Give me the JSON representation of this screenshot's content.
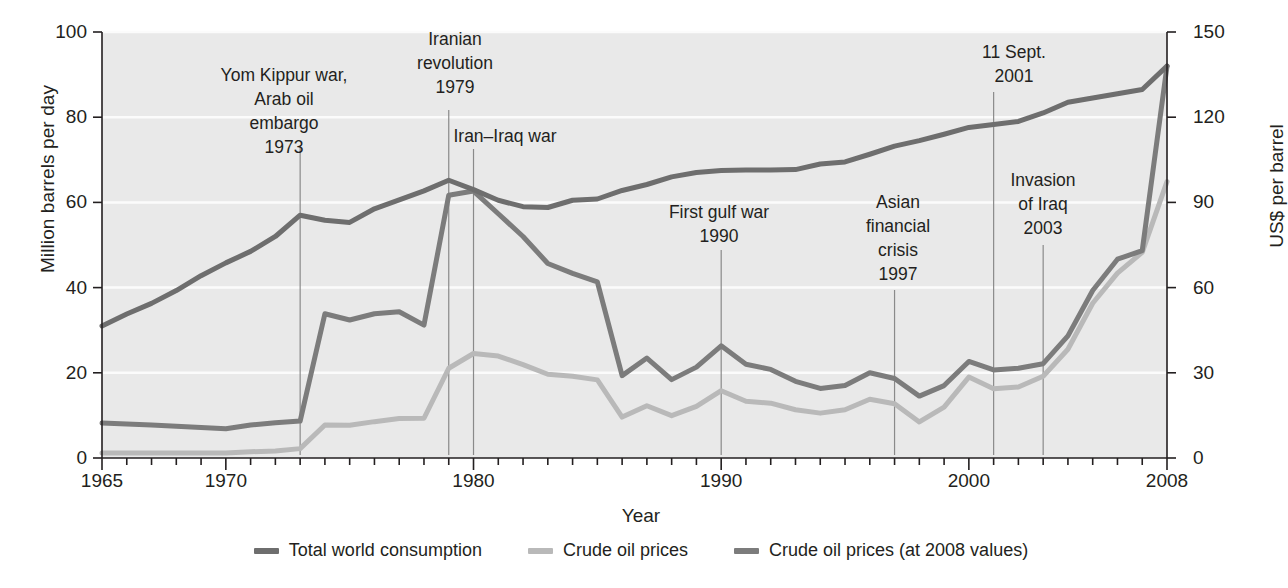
{
  "chart_data": {
    "type": "line",
    "title": "",
    "xlabel": "Year",
    "ylabel": "Million barrels per day",
    "ylabel_right": "US$ per barrel",
    "xlim": [
      1965,
      2008
    ],
    "ylim": [
      0,
      100
    ],
    "ylim_right": [
      0,
      150
    ],
    "grid": true,
    "legend_position": "bottom",
    "xticks": [
      1965,
      1970,
      1980,
      1990,
      2000,
      2008
    ],
    "xtick_labels": [
      "1965",
      "1970",
      "1980",
      "1990",
      "2000",
      "2008"
    ],
    "yticks_left": [
      0,
      20,
      40,
      60,
      80,
      100
    ],
    "ytick_labels_left": [
      "0",
      "20",
      "40",
      "60",
      "80",
      "100"
    ],
    "yticks_right": [
      0,
      30,
      60,
      90,
      120,
      150
    ],
    "ytick_labels_right": [
      "0",
      "30",
      "60",
      "90",
      "120",
      "150"
    ],
    "x": [
      1965,
      1966,
      1967,
      1968,
      1969,
      1970,
      1971,
      1972,
      1973,
      1974,
      1975,
      1976,
      1977,
      1978,
      1979,
      1980,
      1981,
      1982,
      1983,
      1984,
      1985,
      1986,
      1987,
      1988,
      1989,
      1990,
      1991,
      1992,
      1993,
      1994,
      1995,
      1996,
      1997,
      1998,
      1999,
      2000,
      2001,
      2002,
      2003,
      2004,
      2005,
      2006,
      2007,
      2008
    ],
    "series": [
      {
        "name": "Total world consumption",
        "axis": "left",
        "color": "#6e6e6e",
        "unit": "million barrels per day",
        "values": [
          31.0,
          33.8,
          36.3,
          39.3,
          42.8,
          45.8,
          48.5,
          52.0,
          57.0,
          55.8,
          55.3,
          58.5,
          60.6,
          62.7,
          65.2,
          63.0,
          60.5,
          59.0,
          58.8,
          60.5,
          60.8,
          62.8,
          64.2,
          66.0,
          67.0,
          67.5,
          67.6,
          67.6,
          67.7,
          69.0,
          69.5,
          71.3,
          73.2,
          74.5,
          76.0,
          77.6,
          78.3,
          79.0,
          81.0,
          83.5,
          84.5,
          85.5,
          86.5,
          92.0
        ]
      },
      {
        "name": "Crude oil prices",
        "axis": "right",
        "color": "#b9b9b9",
        "unit": "US$ per barrel (nominal)",
        "values": [
          1.8,
          1.8,
          1.8,
          1.8,
          1.8,
          1.8,
          2.2,
          2.5,
          3.3,
          11.6,
          11.5,
          12.8,
          13.9,
          14.0,
          31.6,
          36.8,
          35.9,
          32.9,
          29.5,
          28.8,
          27.5,
          14.4,
          18.4,
          14.9,
          18.2,
          23.7,
          20.0,
          19.3,
          17.0,
          15.8,
          17.0,
          20.7,
          19.1,
          12.7,
          17.9,
          28.5,
          24.4,
          25.0,
          28.8,
          38.3,
          54.5,
          65.1,
          72.4,
          97.3
        ]
      },
      {
        "name": "Crude oil prices (at 2008 values)",
        "axis": "right",
        "color": "#7c7c7c",
        "unit": "US$ per barrel (2008 dollars)",
        "values": [
          12.3,
          12.0,
          11.6,
          11.2,
          10.7,
          10.3,
          11.6,
          12.4,
          13.0,
          50.8,
          48.6,
          50.8,
          51.5,
          46.8,
          92.5,
          94.0,
          86.0,
          78.0,
          68.5,
          65.0,
          62.0,
          29.0,
          35.2,
          27.6,
          32.0,
          39.5,
          33.0,
          31.2,
          27.0,
          24.5,
          25.5,
          30.0,
          28.0,
          21.8,
          25.5,
          34.0,
          31.0,
          31.6,
          33.2,
          43.0,
          59.0,
          70.0,
          73.0,
          138.0
        ]
      }
    ],
    "annotations": [
      {
        "id": "yom-kippur",
        "text": "Yom Kippur war,\nArab oil\nembargo\n1973",
        "year": 1973,
        "label_x": 284,
        "label_y": 63,
        "line_top": 146,
        "line_bottom": 455
      },
      {
        "id": "iranian-revolution",
        "text": "Iranian\nrevolution\n1979",
        "year": 1979,
        "label_x": 455,
        "label_y": 27,
        "line_top": 110,
        "line_bottom": 455
      },
      {
        "id": "iran-iraq-war",
        "text": "Iran–Iraq war",
        "year": 1980,
        "label_x": 505,
        "label_y": 124,
        "line_top": 149,
        "line_bottom": 455
      },
      {
        "id": "first-gulf-war",
        "text": "First gulf war\n1990",
        "year": 1990,
        "label_x": 719,
        "label_y": 200,
        "line_top": 250,
        "line_bottom": 455
      },
      {
        "id": "asian-financial-crisis",
        "text": "Asian\nfinancial\ncrisis\n1997",
        "year": 1997,
        "label_x": 898,
        "label_y": 190,
        "line_top": 290,
        "line_bottom": 455
      },
      {
        "id": "11-sept",
        "text": "11 Sept.\n2001",
        "year": 2001,
        "label_x": 1014,
        "label_y": 40,
        "line_top": 92,
        "line_bottom": 455
      },
      {
        "id": "invasion-of-iraq",
        "text": "Invasion\nof Iraq\n2003",
        "year": 2003,
        "label_x": 1043,
        "label_y": 168,
        "line_top": 245,
        "line_bottom": 455
      }
    ]
  },
  "legend": {
    "items": [
      {
        "label": "Total world consumption",
        "color": "#6e6e6e"
      },
      {
        "label": "Crude oil prices",
        "color": "#b9b9b9"
      },
      {
        "label": "Crude oil prices (at 2008 values)",
        "color": "#7c7c7c"
      }
    ]
  },
  "colors": {
    "plot_background": "#e9e9e9",
    "gridline": "#fbfbfb",
    "axis": "#231f20",
    "text": "#231f20",
    "annotation_line": "#8a8a8a"
  }
}
